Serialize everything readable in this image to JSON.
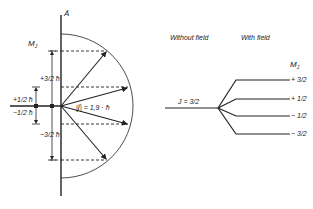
{
  "left_diagram": {
    "axis_label": "Ā",
    "mj_label": "M",
    "mj_sub": "J",
    "vector_label": "|J⃗| = 1,9 · ħ",
    "labels": {
      "plus_three_halves": "+3/2 ħ",
      "plus_one_half": "+1/2 ħ",
      "minus_one_half": "−1/2 ħ",
      "minus_three_halves": "−3/2 ħ"
    },
    "projections": [
      {
        "mj": "+3/2",
        "y": 51,
        "tip_x": 107
      },
      {
        "mj": "+1/2",
        "y": 87,
        "tip_x": 128
      },
      {
        "mj": "-1/2",
        "y": 124,
        "tip_x": 128
      },
      {
        "mj": "-3/2",
        "y": 160,
        "tip_x": 107
      }
    ]
  },
  "right_diagram": {
    "heading_without": "Without field",
    "heading_with": "With field",
    "level_label": "J = 3/2",
    "mj_label": "M",
    "mj_sub": "J",
    "sublevels": [
      {
        "label": "+ 3/2",
        "y": 60
      },
      {
        "label": "+ 1/2",
        "y": 79
      },
      {
        "label": "− 1/2",
        "y": 96
      },
      {
        "label": "− 3/2",
        "y": 114
      }
    ]
  },
  "colors": {
    "line": "#222222",
    "background": "#ffffff"
  }
}
